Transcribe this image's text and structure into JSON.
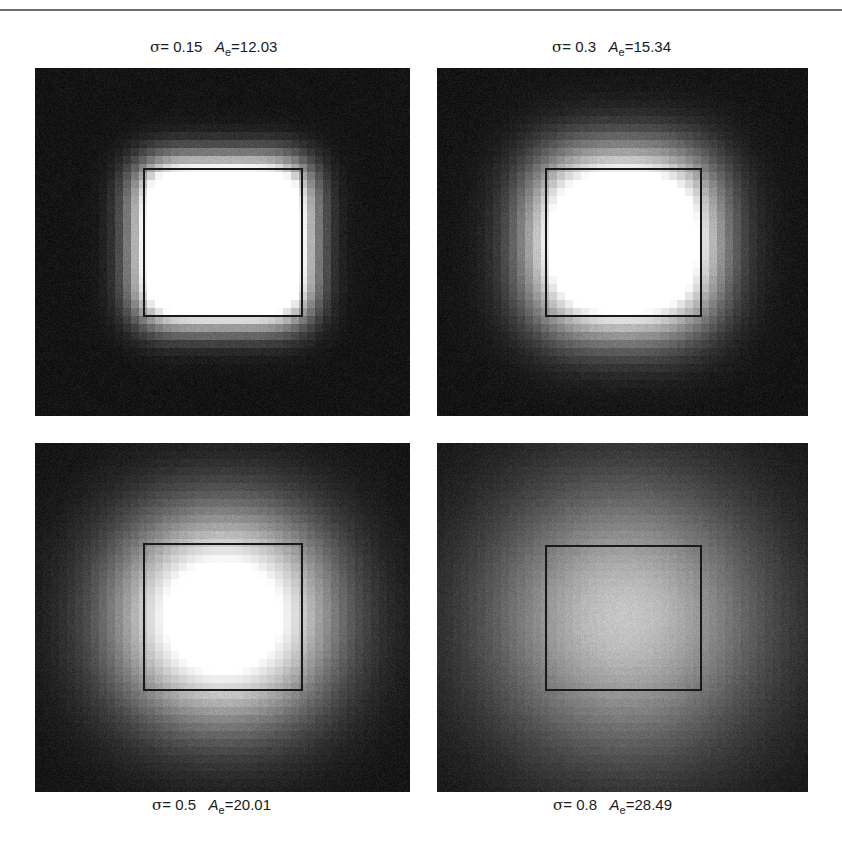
{
  "figure": {
    "panels": [
      {
        "id": "sigma-0.15",
        "sigma_symbol": "σ",
        "sigma_label": "= 0.15",
        "ae_symbol": "A",
        "ae_subscript": "e",
        "ae_label": "=12.03",
        "sigma": 0.15,
        "A_e": 12.03,
        "caption_position": "top"
      },
      {
        "id": "sigma-0.3",
        "sigma_symbol": "σ",
        "sigma_label": "= 0.3",
        "ae_symbol": "A",
        "ae_subscript": "e",
        "ae_label": "=15.34",
        "sigma": 0.3,
        "A_e": 15.34,
        "caption_position": "top"
      },
      {
        "id": "sigma-0.5",
        "sigma_symbol": "σ",
        "sigma_label": "= 0.5",
        "ae_symbol": "A",
        "ae_subscript": "e",
        "ae_label": "=20.01",
        "sigma": 0.5,
        "A_e": 20.01,
        "caption_position": "bottom"
      },
      {
        "id": "sigma-0.8",
        "sigma_symbol": "σ",
        "sigma_label": "= 0.8",
        "ae_symbol": "A",
        "ae_subscript": "e",
        "ae_label": "=28.49",
        "sigma": 0.8,
        "A_e": 28.49,
        "caption_position": "bottom"
      }
    ]
  },
  "colors": {
    "background": "#141414",
    "glow": "#ffffff",
    "outline": "#1a1a1a",
    "rule": "#6d6d6d"
  }
}
